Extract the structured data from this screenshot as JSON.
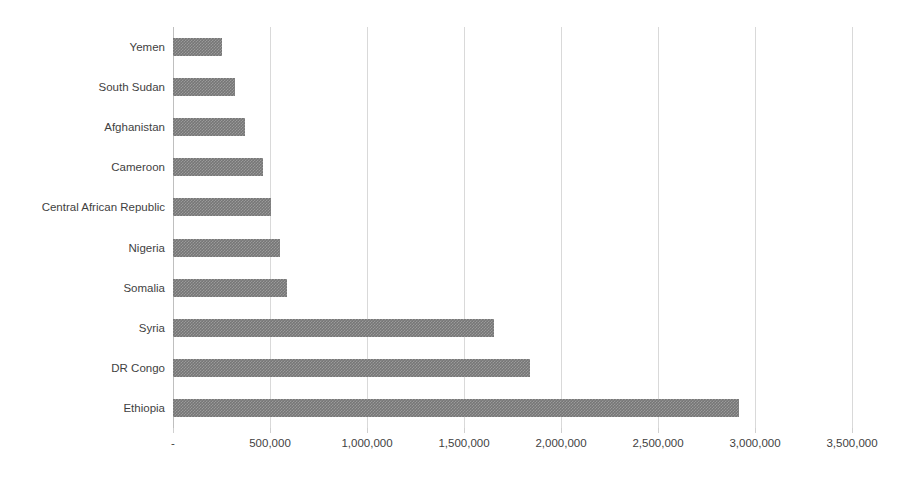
{
  "chart_data": {
    "type": "bar",
    "orientation": "horizontal",
    "title": "",
    "subtitle": "",
    "xlabel": "",
    "ylabel": "",
    "grid": true,
    "legend": false,
    "xlim": [
      0,
      3500000
    ],
    "categories": [
      "Yemen",
      "South Sudan",
      "Afghanistan",
      "Cameroon",
      "Central African Republic",
      "Nigeria",
      "Somalia",
      "Syria",
      "DR Congo",
      "Ethiopia"
    ],
    "values": [
      250000,
      320000,
      370000,
      465000,
      505000,
      550000,
      590000,
      1655000,
      1840000,
      2920000
    ],
    "xticks": [
      0,
      500000,
      1000000,
      1500000,
      2000000,
      2500000,
      3000000,
      3500000
    ],
    "xticklabels": [
      "-",
      "500,000",
      "1,000,000",
      "1,500,000",
      "2,000,000",
      "2,500,000",
      "3,000,000",
      "3,500,000"
    ],
    "bar_color": "#767676",
    "gridline_color": "#d9d9d9",
    "background_color": "#ffffff",
    "text_color": "#3f3f3f"
  }
}
